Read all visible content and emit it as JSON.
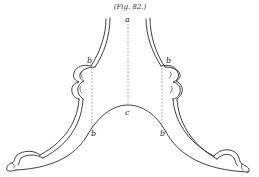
{
  "figure": {
    "caption": "(Fig. 82.)",
    "labels": {
      "top_center": "a",
      "upper_left": "b",
      "upper_right": "b",
      "arch_center": "c",
      "lower_left": "b",
      "lower_right": "b"
    },
    "colors": {
      "ink": "#2a2a2a",
      "background": "#ffffff"
    }
  }
}
